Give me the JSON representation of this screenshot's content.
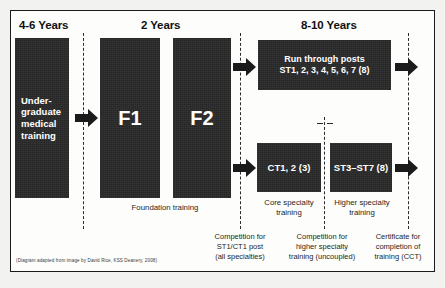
{
  "diagram": {
    "credit": "(Diagram adapted from image by David Rice, KSS Deanery, 2008)",
    "colors": {
      "block_fill": "#262626",
      "block_text": "#ffffff",
      "line": "#2b2b2b",
      "frame": "#1b1b1b",
      "page_background": "#f2f2f0",
      "panel_background": "#fdfdfb"
    },
    "eras": [
      {
        "id": "era-undergraduate",
        "label": "4-6 Years"
      },
      {
        "id": "era-foundation",
        "label": "2 Years"
      },
      {
        "id": "era-specialty",
        "label": "8-10 Years"
      }
    ],
    "blocks": [
      {
        "id": "undergraduate",
        "line1": "Under-",
        "line2": "graduate",
        "line3": "medical",
        "line4": "training"
      },
      {
        "id": "f1",
        "label": "F1"
      },
      {
        "id": "f2",
        "label": "F2"
      },
      {
        "id": "run-through",
        "line1": "Run through posts",
        "line2": "ST1, 2, 3, 4, 5, 6, 7 (8)"
      },
      {
        "id": "core-training",
        "label": "CT1, 2 (3)"
      },
      {
        "id": "higher-training",
        "label": "ST3–ST7 (8)"
      }
    ],
    "stage_captions": [
      {
        "id": "foundation-training",
        "label": "Foundation training"
      },
      {
        "id": "core-specialty-training",
        "line1": "Core specialty",
        "line2": "training"
      },
      {
        "id": "higher-specialty-training",
        "line1": "Higher specialty",
        "line2": "training"
      }
    ],
    "gate_captions": [
      {
        "id": "competition-st1-ct1",
        "line1": "Competition for",
        "line2": "ST1/CT1 post",
        "line3": "(all specialties)"
      },
      {
        "id": "competition-higher-specialty",
        "line1": "Competition for",
        "line2": "higher specialty",
        "line3": "training (uncoupled)"
      },
      {
        "id": "certificate-cct",
        "line1": "Certificate for",
        "line2": "completion of",
        "line3": "training (CCT)"
      }
    ],
    "transition_lines": [
      {
        "id": "gate-1"
      },
      {
        "id": "gate-2"
      },
      {
        "id": "gate-3"
      },
      {
        "id": "gate-4"
      }
    ],
    "arrows": [
      {
        "id": "arrow-undergrad-to-f1"
      },
      {
        "id": "arrow-f2-to-runthrough"
      },
      {
        "id": "arrow-f2-to-core"
      },
      {
        "id": "arrow-runthrough-to-cct"
      },
      {
        "id": "arrow-higher-to-cct"
      }
    ]
  }
}
